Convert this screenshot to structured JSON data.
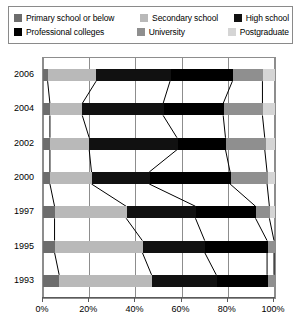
{
  "legend": {
    "items": [
      {
        "label": "Primary school or below",
        "color": "#6d6d6d",
        "icon": "legend-swatch"
      },
      {
        "label": "Secondary school",
        "color": "#b9b9b9",
        "icon": "legend-swatch"
      },
      {
        "label": "High school",
        "color": "#111111",
        "icon": "legend-swatch"
      },
      {
        "label": "Professional colleges",
        "color": "#000000",
        "icon": "legend-swatch"
      },
      {
        "label": "University",
        "color": "#8f8f8f",
        "icon": "legend-swatch"
      },
      {
        "label": "Postgraduate",
        "color": "#d5d5d5",
        "icon": "legend-swatch"
      }
    ]
  },
  "chart_data": {
    "type": "bar",
    "title": "",
    "subtitle": "",
    "xlabel": "",
    "ylabel": "",
    "orientation": "horizontal",
    "stacked": true,
    "normalized_percent": true,
    "grid": true,
    "legend_position": "top",
    "connectors": true,
    "xlim": [
      0,
      100
    ],
    "xticks": [
      0,
      20,
      40,
      60,
      80,
      100
    ],
    "xtick_labels": [
      "0%",
      "20%",
      "40%",
      "60%",
      "80%",
      "100%"
    ],
    "categories": [
      "2006",
      "2004",
      "2002",
      "2000",
      "1997",
      "1995",
      "1993"
    ],
    "series": [
      {
        "name": "Primary school or below",
        "color": "#6d6d6d",
        "values": [
          2,
          3,
          3,
          3,
          5,
          5,
          7
        ]
      },
      {
        "name": "Secondary school",
        "color": "#b9b9b9",
        "values": [
          21,
          14,
          17,
          18,
          31,
          38,
          40
        ]
      },
      {
        "name": "High school",
        "color": "#111111",
        "values": [
          32,
          35,
          38,
          25,
          30,
          27,
          28
        ]
      },
      {
        "name": "Professional colleges",
        "color": "#000000",
        "values": [
          27,
          26,
          21,
          35,
          26,
          27,
          22
        ]
      },
      {
        "name": "University",
        "color": "#8f8f8f",
        "values": [
          13,
          17,
          17,
          16,
          6,
          3,
          3
        ]
      },
      {
        "name": "Postgraduate",
        "color": "#d5d5d5",
        "values": [
          5,
          5,
          4,
          3,
          2,
          0,
          0
        ]
      }
    ]
  }
}
